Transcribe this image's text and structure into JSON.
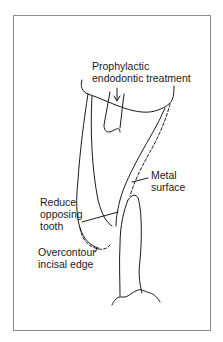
{
  "figure": {
    "type": "dental diagram",
    "labels": {
      "prophylactic_line1": "Prophylactic",
      "prophylactic_line2": "endodontic treatment",
      "metal_line1": "Metal",
      "metal_line2": "surface",
      "reduce_line1": "Reduce",
      "reduce_line2": "opposing",
      "reduce_line3": "tooth",
      "overcontour_line1": "Overcontour",
      "overcontour_line2": "incisal edge"
    },
    "colors": {
      "line": "#1a1a1a",
      "frame": "#8a8a8a",
      "background": "#ffffff"
    }
  }
}
